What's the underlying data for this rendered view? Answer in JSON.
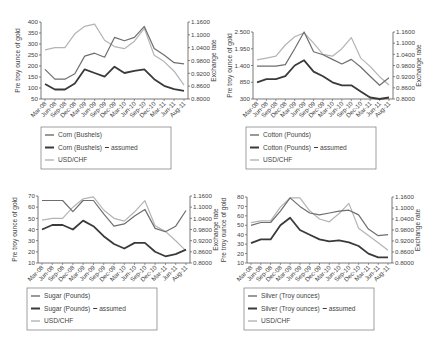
{
  "chart_data": [
    {
      "type": "line",
      "id": "corn",
      "title": "",
      "x": [
        "Mar-08",
        "Jun-08",
        "Sep-08",
        "Dec-08",
        "Mar-09",
        "Jun-09",
        "Sep-09",
        "Dec-09",
        "Mar-10",
        "Jun-10",
        "Sep-10",
        "Dec-10",
        "Mar-11",
        "Jun-11",
        "Aug-11"
      ],
      "ylabel": "Pre troy ounce of gold",
      "y2label": "Exchange rate",
      "ylim": [
        50,
        400
      ],
      "yticks": [
        "50",
        "100",
        "150",
        "200",
        "250",
        "300",
        "350",
        "400"
      ],
      "y2lim": [
        0.8,
        1.16
      ],
      "y2ticks": [
        "0.8000",
        "0.8600",
        "0.9200",
        "0.9800",
        "1.0400",
        "1.1000",
        "1.1600"
      ],
      "series": [
        {
          "name": "Corn (Bushels)",
          "axis": "left",
          "color": "#6e6e6e",
          "width": 1.2,
          "values": [
            185,
            140,
            140,
            165,
            245,
            258,
            240,
            330,
            315,
            330,
            380,
            280,
            250,
            215,
            210
          ]
        },
        {
          "name": "Corn (Bushels) – assumed",
          "axis": "left",
          "color": "#3a3a3a",
          "width": 1.8,
          "values": [
            118,
            93,
            93,
            120,
            185,
            168,
            152,
            197,
            168,
            178,
            185,
            140,
            110,
            95,
            87
          ]
        },
        {
          "name": "USD/CHF",
          "axis": "right",
          "color": "#b4b4b4",
          "width": 1.2,
          "values": [
            1.03,
            1.04,
            1.04,
            1.105,
            1.14,
            1.15,
            1.075,
            1.045,
            1.035,
            1.07,
            1.13,
            1.005,
            0.975,
            0.93,
            0.865
          ]
        }
      ],
      "legend": {
        "position": "bottom",
        "labels": [
          "Corn (Bushels)",
          "Corn (Bushels)",
          "USD/CHF"
        ],
        "assumed_suffix": "assumed"
      },
      "grid": false
    },
    {
      "type": "line",
      "id": "cotton",
      "title": "",
      "x": [
        "Mar-08",
        "Jun-08",
        "Sep-08",
        "Dec-08",
        "Mar-09",
        "Jun-09",
        "Sep-09",
        "Dec-09",
        "Mar-10",
        "Jun-10",
        "Sep-10",
        "Dec-10",
        "Mar-11",
        "Jun-11",
        "Aug-11"
      ],
      "ylabel": "Pre troy ounce of gold",
      "y2label": "Exchange rate",
      "ylim": [
        300,
        2500
      ],
      "yticks": [
        "300",
        "850",
        "1.400",
        "1.950",
        "2.500"
      ],
      "y2lim": [
        0.8,
        1.16
      ],
      "y2ticks": [
        "0.8000",
        "0.8600",
        "0.9200",
        "0.9800",
        "1.0400",
        "1.1000",
        "1.1600"
      ],
      "series": [
        {
          "name": "Cotton (Pounds)",
          "axis": "left",
          "color": "#6e6e6e",
          "width": 1.2,
          "values": [
            1380,
            1380,
            1380,
            1430,
            1950,
            2500,
            1850,
            1750,
            1600,
            1450,
            1600,
            1350,
            1050,
            750,
            1000
          ]
        },
        {
          "name": "Cotton (Pounds) – assumed",
          "axis": "left",
          "color": "#3a3a3a",
          "width": 1.8,
          "values": [
            850,
            950,
            950,
            1050,
            1400,
            1570,
            1200,
            1050,
            850,
            750,
            750,
            550,
            350,
            300,
            350
          ]
        },
        {
          "name": "USD/CHF",
          "axis": "right",
          "color": "#b4b4b4",
          "width": 1.2,
          "values": [
            1.01,
            1.02,
            1.03,
            1.09,
            1.135,
            1.155,
            1.1,
            1.04,
            1.03,
            1.07,
            1.13,
            1.02,
            0.975,
            0.92,
            0.875
          ]
        }
      ],
      "legend": {
        "position": "bottom",
        "labels": [
          "Cotton (Pounds)",
          "Cotton (Pounds)",
          "USD/CHF"
        ],
        "assumed_suffix": "assumed"
      },
      "grid": false
    },
    {
      "type": "line",
      "id": "sugar",
      "title": "",
      "x": [
        "Mar-08",
        "Jun-08",
        "Sep-08",
        "Dec-08",
        "Mar-09",
        "Jun-09",
        "Sep-09",
        "Dec-09",
        "Mar-10",
        "Jun-10",
        "Sep-10",
        "Dec-10",
        "Mar-11",
        "Jun-11",
        "Aug-11"
      ],
      "ylabel": "Pre troy ounce of gold",
      "y2label": "Exchange rate",
      "ylim": [
        10,
        70
      ],
      "yticks": [
        "10",
        "20",
        "30",
        "40",
        "50",
        "60",
        "70"
      ],
      "y2lim": [
        0.8,
        1.16
      ],
      "y2ticks": [
        "0.8000",
        "0.8600",
        "0.9200",
        "0.9800",
        "1.0400",
        "1.1000",
        "1.1600"
      ],
      "series": [
        {
          "name": "Sugar (Pounds)",
          "axis": "left",
          "color": "#6e6e6e",
          "width": 1.2,
          "values": [
            66,
            66,
            66,
            56,
            66,
            66,
            54,
            43,
            45,
            52,
            58,
            41,
            38,
            43,
            57
          ]
        },
        {
          "name": "Sugar (Pounds) – assumed",
          "axis": "left",
          "color": "#3a3a3a",
          "width": 1.8,
          "values": [
            40,
            44,
            44,
            40,
            48,
            43,
            34,
            27,
            23,
            28,
            28,
            20,
            16,
            18,
            22
          ]
        },
        {
          "name": "USD/CHF",
          "axis": "right",
          "color": "#b4b4b4",
          "width": 1.2,
          "values": [
            1.03,
            1.04,
            1.04,
            1.1,
            1.145,
            1.155,
            1.085,
            1.04,
            1.025,
            1.075,
            1.135,
            1.0,
            0.97,
            0.92,
            0.865
          ]
        }
      ],
      "legend": {
        "position": "bottom",
        "labels": [
          "Sugar (Pounds)",
          "Sugar (Pounds)",
          "USD/CHF"
        ],
        "assumed_suffix": "assumed"
      },
      "grid": false
    },
    {
      "type": "line",
      "id": "silver",
      "title": "",
      "x": [
        "Mar-08",
        "Jun-08",
        "Sep-08",
        "Dec-08",
        "Mar-09",
        "Jun-09",
        "Sep-09",
        "Dec-09",
        "Mar-10",
        "Jun-10",
        "Sep-10",
        "Dec-10",
        "Mar-11",
        "Jun-11",
        "Aug-11"
      ],
      "ylabel": "Pre troy ounce of gold",
      "y2label": "Exchange rate",
      "ylim": [
        10,
        80
      ],
      "yticks": [
        "10",
        "20",
        "30",
        "40",
        "50",
        "60",
        "70",
        "80"
      ],
      "y2lim": [
        0.8,
        1.16
      ],
      "y2ticks": [
        "0.8000",
        "0.8600",
        "0.9200",
        "0.9800",
        "1.0400",
        "1.1000",
        "1.1600"
      ],
      "series": [
        {
          "name": "Silver (Troy ounces)",
          "axis": "left",
          "color": "#6e6e6e",
          "width": 1.2,
          "values": [
            50,
            53,
            53,
            65,
            79,
            70,
            63,
            61,
            63,
            65,
            66,
            61,
            46,
            39,
            40
          ]
        },
        {
          "name": "Silver (Troy ounces) – assumed",
          "axis": "left",
          "color": "#3a3a3a",
          "width": 1.8,
          "values": [
            31,
            35,
            35,
            50,
            58,
            45,
            40,
            35,
            33,
            34,
            32,
            28,
            20,
            16,
            16
          ]
        },
        {
          "name": "USD/CHF",
          "axis": "right",
          "color": "#b4b4b4",
          "width": 1.2,
          "values": [
            1.02,
            1.03,
            1.03,
            1.105,
            1.155,
            1.155,
            1.085,
            1.04,
            1.025,
            1.07,
            1.125,
            0.99,
            0.95,
            0.91,
            0.87
          ]
        }
      ],
      "legend": {
        "position": "bottom",
        "labels": [
          "Silver (Troy ounces)",
          "Silver (Troy ounces)",
          "USD/CHF"
        ],
        "assumed_suffix": "assumed"
      },
      "grid": false
    }
  ]
}
